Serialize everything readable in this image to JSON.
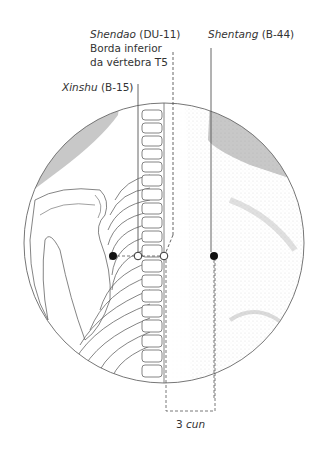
{
  "labels": {
    "shendao_name": "Shendao",
    "shendao_code": "(DU-11)",
    "shendao_line2": "Borda inferior",
    "shendao_line3": "da vértebra T5",
    "shentang_name": "Shentang",
    "shentang_code": "(B-44)",
    "xinshu_name": "Xinshu",
    "xinshu_code": "(B-15)",
    "measure_value": "3",
    "measure_unit": "cun"
  },
  "points": [
    {
      "name": "Xinshu (B-15)",
      "style": "open"
    },
    {
      "name": "Shendao (DU-11)",
      "style": "open"
    },
    {
      "name": "Shentang (B-44)",
      "style": "filled"
    },
    {
      "name": "Medial scapula marker",
      "style": "filled"
    }
  ],
  "colors": {
    "line": "#555555",
    "shade": "#c8c8c8",
    "point": "#111111"
  }
}
